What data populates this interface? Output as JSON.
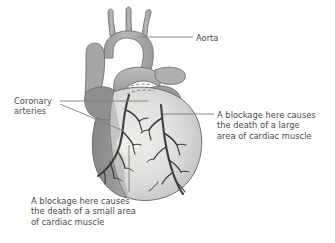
{
  "figure": {
    "background_color": "#ffffff"
  },
  "labels": {
    "aorta": "Aorta",
    "coronary_arteries": "Coronary\narteries",
    "large_blockage": "A blockage here causes\nthe death of a large\narea of cardiac muscle",
    "small_blockage": "A blockage here causes\nthe death of a small area\nof cardiac muscle"
  },
  "colors": {
    "text": "#4a4a4a",
    "leader_line": "#7d7d7d",
    "vessel_light": "#b9b9b9",
    "vessel_mid": "#a8a8a8",
    "vessel_dark": "#9a9a9a",
    "right_ventricle": "#8e8e8e",
    "left_ventricle": "#d7d7d4",
    "left_ventricle_pale": "#e4e4e1",
    "atrium": "#9f9f9f",
    "artery": "#3e3e42",
    "outline": "#6f6f6f",
    "highlight_circle": "#ecece8",
    "dashed_line": "#8a8a8a"
  },
  "anatomy": {
    "aortic_arch": "aortic-arch",
    "brachiocephalic_branches": 3,
    "pulmonary_artery": "pulmonary-artery",
    "superior_vena_cava": "superior-vena-cava",
    "right_ventricle": "right-ventricle",
    "left_ventricle": "left-ventricle",
    "right_coronary_artery": "right-coronary-artery",
    "left_coronary_artery": "left-coronary-artery",
    "small_infarct_marker": "small-infarct-highlight"
  }
}
